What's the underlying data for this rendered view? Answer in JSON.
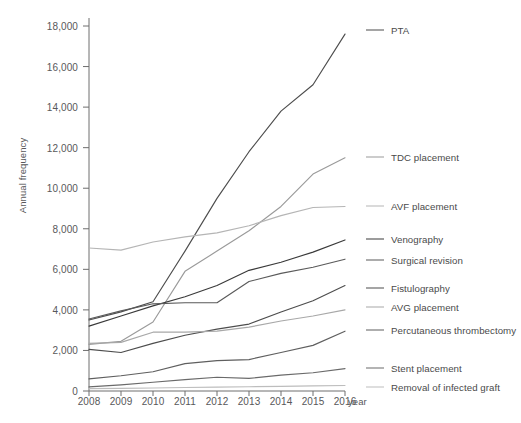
{
  "chart_data": {
    "type": "line",
    "title": "",
    "xlabel": "year",
    "ylabel": "Annual frequency",
    "x": [
      2008,
      2009,
      2010,
      2011,
      2012,
      2013,
      2014,
      2015,
      2016
    ],
    "categories": [
      "2008",
      "2009",
      "2010",
      "2011",
      "2012",
      "2013",
      "2014",
      "2015",
      "2016"
    ],
    "xlim": [
      2008,
      2016
    ],
    "ylim": [
      0,
      18000
    ],
    "yticks": [
      0,
      2000,
      4000,
      6000,
      8000,
      10000,
      12000,
      14000,
      16000,
      18000
    ],
    "ytick_labels": [
      "0",
      "2,000",
      "4,000",
      "6,000",
      "8,000",
      "10,000",
      "12,000",
      "14,000",
      "16,000",
      "18,000"
    ],
    "grid": false,
    "legend_position": "right",
    "series": [
      {
        "name": "PTA",
        "color": "#4d4d4d",
        "values": [
          3500,
          3900,
          4400,
          6900,
          9500,
          11800,
          13800,
          15100,
          17600
        ]
      },
      {
        "name": "TDC placement",
        "color": "#9a9a9a",
        "values": [
          2300,
          2450,
          3400,
          5900,
          6900,
          7900,
          9100,
          10700,
          11500
        ]
      },
      {
        "name": "AVF placement",
        "color": "#b5b5b5",
        "values": [
          7050,
          6950,
          7350,
          7600,
          7800,
          8150,
          8650,
          9050,
          9100
        ]
      },
      {
        "name": "Venography",
        "color": "#3a3a3a",
        "values": [
          3200,
          3700,
          4200,
          4650,
          5200,
          5950,
          6350,
          6850,
          7450
        ]
      },
      {
        "name": "Surgical revision",
        "color": "#5a5a5a",
        "values": [
          3550,
          3950,
          4300,
          4350,
          4350,
          5400,
          5800,
          6100,
          6500
        ]
      },
      {
        "name": "Fistulography",
        "color": "#4d4d4d",
        "values": [
          2050,
          1900,
          2350,
          2750,
          3050,
          3300,
          3900,
          4450,
          5200
        ]
      },
      {
        "name": "AVG placement",
        "color": "#a8a8a8",
        "values": [
          2350,
          2400,
          2900,
          2900,
          2950,
          3150,
          3450,
          3700,
          4000
        ]
      },
      {
        "name": "Percutaneous thrombectomy",
        "color": "#5f5f5f",
        "values": [
          600,
          750,
          950,
          1350,
          1500,
          1550,
          1900,
          2250,
          2950
        ]
      },
      {
        "name": "Stent placement",
        "color": "#6a6a6a",
        "values": [
          200,
          300,
          430,
          560,
          680,
          620,
          780,
          900,
          1100
        ]
      },
      {
        "name": "Removal of infected graft",
        "color": "#bdbdbd",
        "values": [
          120,
          130,
          150,
          170,
          190,
          210,
          230,
          250,
          270
        ]
      }
    ]
  },
  "legend": {
    "items": [
      {
        "label": "PTA",
        "color": "#4d4d4d",
        "y": 30
      },
      {
        "label": "TDC placement",
        "color": "#9a9a9a",
        "y": 157
      },
      {
        "label": "AVF placement",
        "color": "#b5b5b5",
        "y": 206
      },
      {
        "label": "Venography",
        "color": "#3a3a3a",
        "y": 239
      },
      {
        "label": "Surgical revision",
        "color": "#5a5a5a",
        "y": 260
      },
      {
        "label": "Fistulography",
        "color": "#4d4d4d",
        "y": 288
      },
      {
        "label": "AVG placement",
        "color": "#a8a8a8",
        "y": 307
      },
      {
        "label": "Percutaneous thrombectomy",
        "color": "#5f5f5f",
        "y": 330
      },
      {
        "label": "Stent placement",
        "color": "#6a6a6a",
        "y": 368
      },
      {
        "label": "Removal of infected graft",
        "color": "#bdbdbd",
        "y": 387
      }
    ]
  },
  "axes": {
    "y_title": "Annual frequency",
    "x_title": "year"
  }
}
